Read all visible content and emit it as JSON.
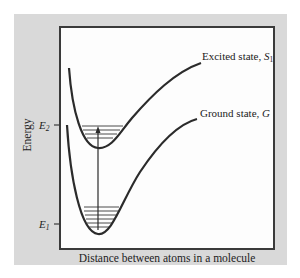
{
  "diagram": {
    "type": "potential-energy-curves",
    "y_axis_label": "Energy",
    "x_axis_label": "Distance between atoms in a molecule",
    "levels": [
      {
        "symbol": "E",
        "subscript": "2",
        "meaning": "excited-state energy level"
      },
      {
        "symbol": "E",
        "subscript": "1",
        "meaning": "ground-state energy level"
      }
    ],
    "curves": [
      {
        "name": "Excited state",
        "label_text": "Excited state, ",
        "symbol": "S",
        "subscript": "1"
      },
      {
        "name": "Ground state",
        "label_text": "Ground state, ",
        "symbol": "G",
        "subscript": ""
      }
    ],
    "transition": {
      "from": "E1",
      "to": "E2",
      "direction": "up",
      "kind": "absorption arrow"
    },
    "vibrational_levels": {
      "excited_well_lines": 4,
      "ground_well_lines": 6
    }
  },
  "colors": {
    "panel_background": "#d9d9d9",
    "plot_background": "#fdfdfd",
    "frame": "#3a3a3a",
    "curve": "#2b2b2b",
    "text": "#222222"
  }
}
